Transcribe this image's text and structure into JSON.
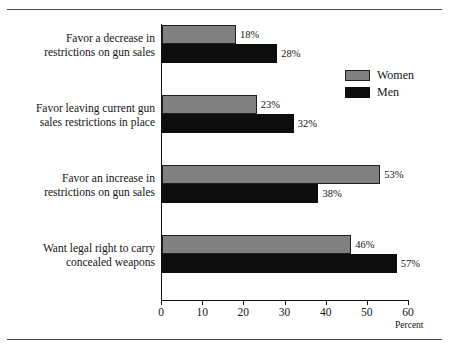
{
  "chart_data": {
    "type": "bar",
    "orientation": "horizontal",
    "title": "",
    "xlabel": "Percent",
    "ylabel": "",
    "xlim": [
      0,
      60
    ],
    "xticks": [
      0,
      10,
      20,
      30,
      40,
      50,
      60
    ],
    "xtick_labels": [
      "0",
      "10",
      "20",
      "30",
      "40",
      "50",
      "60"
    ],
    "grid": false,
    "legend_position": "right",
    "categories": [
      "Favor a decrease in restrictions on gun sales",
      "Favor leaving current gun sales restrictions in place",
      "Favor an increase in restrictions on gun sales",
      "Want legal right to carry concealed weapons"
    ],
    "category_lines": [
      [
        "Favor a decrease in",
        "restrictions on gun sales"
      ],
      [
        "Favor leaving current gun",
        "sales restrictions in place"
      ],
      [
        "Favor an increase in",
        "restrictions on gun sales"
      ],
      [
        "Want legal right to carry",
        "concealed weapons"
      ]
    ],
    "series": [
      {
        "name": "Women",
        "color": "#808080",
        "values": [
          18,
          23,
          53,
          46
        ],
        "value_labels": [
          "18%",
          "23%",
          "53%",
          "46%"
        ]
      },
      {
        "name": "Men",
        "color": "#0d0d0d",
        "values": [
          28,
          32,
          38,
          57
        ],
        "value_labels": [
          "28%",
          "32%",
          "38%",
          "57%"
        ]
      }
    ]
  },
  "legend": {
    "items": [
      {
        "label": "Women",
        "swatch": "women"
      },
      {
        "label": "Men",
        "swatch": "men"
      }
    ]
  }
}
